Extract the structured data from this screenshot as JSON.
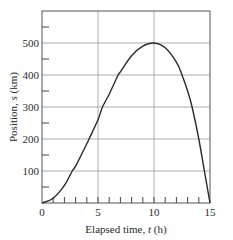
{
  "chart_data": {
    "type": "line",
    "title": "",
    "xlabel": "Elapsed time, t (h)",
    "xlabel_parts": {
      "prefix": "Elapsed time, ",
      "var": "t",
      "suffix": " (h)"
    },
    "ylabel": "Position, s (km)",
    "ylabel_parts": {
      "prefix": "Position, ",
      "var": "s",
      "suffix": " (km)"
    },
    "xlim": [
      0,
      15
    ],
    "ylim": [
      0,
      600
    ],
    "xticks": [
      0,
      5,
      10,
      15
    ],
    "xtick_labels": [
      "0",
      "5",
      "10",
      "15"
    ],
    "x_minor_tick_step": 1,
    "yticks": [
      100,
      200,
      300,
      400,
      500
    ],
    "ytick_labels": [
      "100",
      "200",
      "300",
      "400",
      "500"
    ],
    "y_minor_tick_step": 50,
    "grid": true,
    "legend": null,
    "series": [
      {
        "name": "position",
        "x": [
          0,
          1,
          2,
          2.7,
          3,
          4,
          4.2,
          5,
          5.4,
          6,
          6.8,
          7,
          8,
          9,
          10,
          11,
          12,
          12.5,
          13,
          13.4,
          14,
          14.5,
          15
        ],
        "values": [
          0,
          15,
          55,
          100,
          115,
          185,
          200,
          260,
          300,
          340,
          400,
          410,
          460,
          490,
          500,
          485,
          440,
          400,
          350,
          300,
          200,
          100,
          0
        ]
      }
    ]
  },
  "colors": {
    "line": "#2a2a2a",
    "grid": "#9a9a9a",
    "frame": "#555555"
  }
}
